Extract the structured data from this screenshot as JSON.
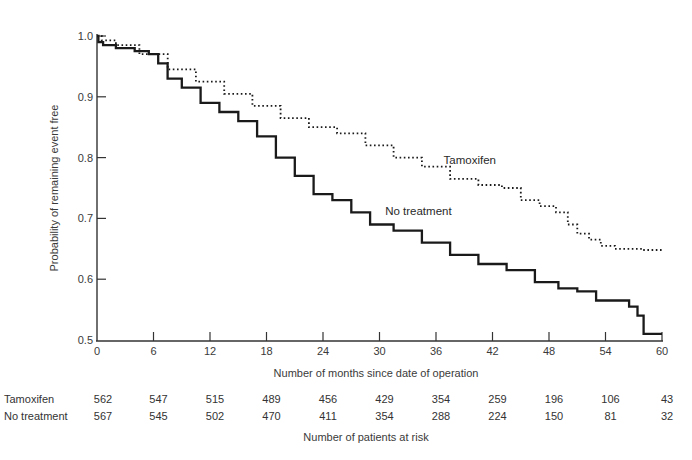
{
  "chart_data": {
    "type": "line",
    "subtype": "kaplan-meier step curve",
    "title": "",
    "xlabel": "Number of months since date of operation",
    "ylabel": "Probability of remaining event free",
    "xlim": [
      0,
      60
    ],
    "ylim": [
      0.5,
      1.0
    ],
    "x_ticks": [
      0,
      6,
      12,
      18,
      24,
      30,
      36,
      42,
      48,
      54,
      60
    ],
    "y_ticks": [
      0.5,
      0.6,
      0.7,
      0.8,
      0.9,
      1.0
    ],
    "y_tick_labels": [
      "0.5",
      "0.6",
      "0.7",
      "0.8",
      "0.9",
      "1.0"
    ],
    "grid": false,
    "legend": "inline labels",
    "series": [
      {
        "name": "Tamoxifen",
        "style": "dotted",
        "label_position": {
          "x": 36.8,
          "y": 0.79
        },
        "x": [
          0,
          1,
          3,
          6,
          9,
          12,
          15,
          18,
          21,
          24,
          27,
          30,
          33,
          36,
          39,
          42,
          44,
          46,
          48,
          49.5,
          50.5,
          51.5,
          53,
          54,
          56,
          60
        ],
        "values": [
          1.0,
          0.993,
          0.985,
          0.97,
          0.945,
          0.925,
          0.905,
          0.885,
          0.865,
          0.85,
          0.84,
          0.82,
          0.8,
          0.785,
          0.765,
          0.755,
          0.75,
          0.73,
          0.72,
          0.71,
          0.69,
          0.675,
          0.665,
          0.655,
          0.65,
          0.648
        ]
      },
      {
        "name": "No treatment",
        "style": "solid",
        "label_position": {
          "x": 30.6,
          "y": 0.705
        },
        "x": [
          0,
          0.3,
          1,
          3,
          5,
          6,
          7,
          8,
          10,
          12,
          14,
          16,
          18,
          20,
          22,
          24,
          26,
          28,
          30,
          33,
          36,
          39,
          42,
          45,
          48,
          50,
          52,
          54,
          56,
          57,
          57.8,
          58.3,
          60
        ],
        "values": [
          1.0,
          0.99,
          0.985,
          0.98,
          0.975,
          0.97,
          0.955,
          0.93,
          0.915,
          0.89,
          0.875,
          0.86,
          0.835,
          0.8,
          0.77,
          0.74,
          0.73,
          0.71,
          0.69,
          0.68,
          0.66,
          0.64,
          0.625,
          0.615,
          0.595,
          0.585,
          0.58,
          0.565,
          0.565,
          0.555,
          0.54,
          0.51,
          0.51
        ]
      }
    ],
    "at_risk_table": {
      "title": "Number of patients at risk",
      "months": [
        0,
        6,
        12,
        18,
        24,
        30,
        36,
        42,
        48,
        54,
        60
      ],
      "rows": [
        {
          "label": "Tamoxifen",
          "values": [
            562,
            547,
            515,
            489,
            456,
            429,
            354,
            259,
            196,
            106,
            43
          ]
        },
        {
          "label": "No treatment",
          "values": [
            567,
            545,
            502,
            470,
            411,
            354,
            288,
            224,
            150,
            81,
            32
          ]
        }
      ]
    }
  }
}
